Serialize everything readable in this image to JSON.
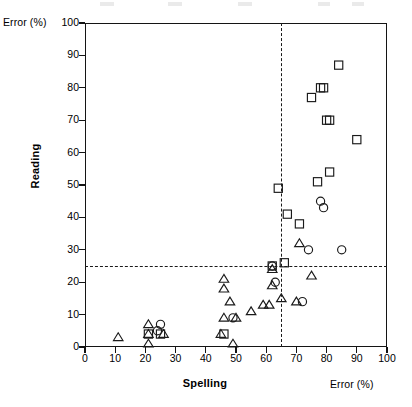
{
  "axes": {
    "y_unit_label": "Error (%)",
    "x_unit_label": "Error (%)",
    "y_title": "Reading",
    "x_title": "Spelling",
    "y_ticks": [
      0,
      10,
      20,
      30,
      40,
      50,
      60,
      70,
      80,
      90,
      100
    ],
    "x_ticks": [
      0,
      10,
      20,
      30,
      40,
      50,
      60,
      70,
      80,
      90,
      100
    ]
  },
  "chart_data": {
    "type": "scatter",
    "title": "",
    "xlabel": "Spelling",
    "ylabel": "Reading",
    "x_unit": "Error (%)",
    "y_unit": "Error (%)",
    "xlim": [
      0,
      100
    ],
    "ylim": [
      0,
      100
    ],
    "grid": false,
    "legend_position": "none",
    "reference_lines": [
      {
        "orientation": "horizontal",
        "value": 25,
        "style": "dashed"
      },
      {
        "orientation": "vertical",
        "value": 65,
        "style": "dashed"
      }
    ],
    "series": [
      {
        "name": "triangle",
        "marker": "triangle",
        "points": [
          [
            11,
            3
          ],
          [
            21,
            7
          ],
          [
            21,
            4
          ],
          [
            21,
            1
          ],
          [
            26,
            4
          ],
          [
            45,
            4
          ],
          [
            46,
            21
          ],
          [
            46,
            18
          ],
          [
            46,
            9
          ],
          [
            48,
            14
          ],
          [
            49,
            1
          ],
          [
            50,
            9
          ],
          [
            55,
            11
          ],
          [
            59,
            13
          ],
          [
            61,
            13
          ],
          [
            62,
            24
          ],
          [
            62,
            19
          ],
          [
            65,
            15
          ],
          [
            70,
            14
          ],
          [
            71,
            32
          ],
          [
            75,
            22
          ]
        ]
      },
      {
        "name": "circle",
        "marker": "circle",
        "points": [
          [
            24,
            5
          ],
          [
            25,
            7
          ],
          [
            49,
            9
          ],
          [
            62,
            25
          ],
          [
            63,
            20
          ],
          [
            72,
            14
          ],
          [
            74,
            30
          ],
          [
            78,
            45
          ],
          [
            79,
            43
          ],
          [
            85,
            30
          ]
        ]
      },
      {
        "name": "square",
        "marker": "square",
        "points": [
          [
            21,
            4
          ],
          [
            25,
            4
          ],
          [
            46,
            4
          ],
          [
            62,
            25
          ],
          [
            64,
            49
          ],
          [
            66,
            26
          ],
          [
            67,
            41
          ],
          [
            71,
            38
          ],
          [
            75,
            77
          ],
          [
            77,
            51
          ],
          [
            78,
            80
          ],
          [
            79,
            80
          ],
          [
            80,
            70
          ],
          [
            81,
            70
          ],
          [
            81,
            54
          ],
          [
            84,
            87
          ],
          [
            90,
            64
          ]
        ]
      }
    ]
  }
}
